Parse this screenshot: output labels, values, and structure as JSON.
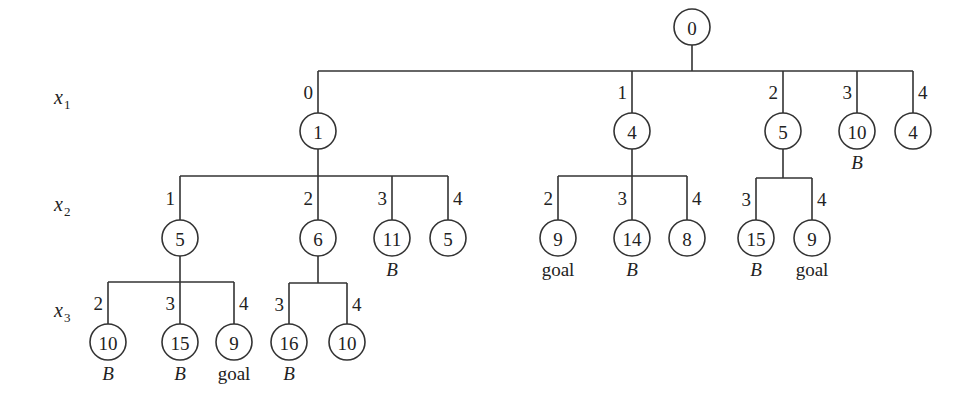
{
  "diagram": {
    "type": "search-tree",
    "levels": [
      {
        "var": "x",
        "sub": "1",
        "y": 98
      },
      {
        "var": "x",
        "sub": "2",
        "y": 205
      },
      {
        "var": "x",
        "sub": "3",
        "y": 311
      }
    ],
    "nodes": [
      {
        "id": "root",
        "value": "0",
        "x": 692,
        "y": 27,
        "parent": null,
        "branch": null,
        "note": null
      },
      {
        "id": "n1",
        "value": "1",
        "x": 318,
        "y": 131,
        "parent": "root",
        "branch": "0",
        "note": null
      },
      {
        "id": "n4",
        "value": "4",
        "x": 632,
        "y": 131,
        "parent": "root",
        "branch": "1",
        "note": null
      },
      {
        "id": "n5",
        "value": "5",
        "x": 783,
        "y": 131,
        "parent": "root",
        "branch": "2",
        "note": null
      },
      {
        "id": "n10",
        "value": "10",
        "x": 857,
        "y": 131,
        "parent": "root",
        "branch": "3",
        "note": "B"
      },
      {
        "id": "n4b",
        "value": "4",
        "x": 913,
        "y": 131,
        "parent": "root",
        "branch": "4",
        "note": null
      },
      {
        "id": "n1_5",
        "value": "5",
        "x": 180,
        "y": 238,
        "parent": "n1",
        "branch": "1",
        "note": null
      },
      {
        "id": "n1_6",
        "value": "6",
        "x": 318,
        "y": 238,
        "parent": "n1",
        "branch": "2",
        "note": null
      },
      {
        "id": "n1_11",
        "value": "11",
        "x": 392,
        "y": 238,
        "parent": "n1",
        "branch": "3",
        "note": "B"
      },
      {
        "id": "n1_5b",
        "value": "5",
        "x": 448,
        "y": 238,
        "parent": "n1",
        "branch": "4",
        "note": null
      },
      {
        "id": "n4_9",
        "value": "9",
        "x": 558,
        "y": 238,
        "parent": "n4",
        "branch": "2",
        "note": "goal"
      },
      {
        "id": "n4_14",
        "value": "14",
        "x": 632,
        "y": 238,
        "parent": "n4",
        "branch": "3",
        "note": "B"
      },
      {
        "id": "n4_8",
        "value": "8",
        "x": 687,
        "y": 238,
        "parent": "n4",
        "branch": "4",
        "note": null
      },
      {
        "id": "n5_15",
        "value": "15",
        "x": 756,
        "y": 238,
        "parent": "n5",
        "branch": "3",
        "note": "B"
      },
      {
        "id": "n5_9",
        "value": "9",
        "x": 812,
        "y": 238,
        "parent": "n5",
        "branch": "4",
        "note": "goal"
      },
      {
        "id": "n15_10",
        "value": "10",
        "x": 108,
        "y": 342,
        "parent": "n1_5",
        "branch": "2",
        "note": "B"
      },
      {
        "id": "n15_15",
        "value": "15",
        "x": 180,
        "y": 342,
        "parent": "n1_5",
        "branch": "3",
        "note": "B"
      },
      {
        "id": "n15_9",
        "value": "9",
        "x": 234,
        "y": 342,
        "parent": "n1_5",
        "branch": "4",
        "note": "goal"
      },
      {
        "id": "n16_16",
        "value": "16",
        "x": 289,
        "y": 342,
        "parent": "n1_6",
        "branch": "3",
        "note": "B"
      },
      {
        "id": "n16_10",
        "value": "10",
        "x": 347,
        "y": 342,
        "parent": "n1_6",
        "branch": "4",
        "note": null
      }
    ],
    "bars": [
      {
        "parent": "root",
        "y": 71
      },
      {
        "parent": "n1",
        "y": 176
      },
      {
        "parent": "n4",
        "y": 176
      },
      {
        "parent": "n5",
        "y": 178
      },
      {
        "parent": "n1_5",
        "y": 282
      },
      {
        "parent": "n1_6",
        "y": 283
      }
    ],
    "node_radius": 18
  }
}
